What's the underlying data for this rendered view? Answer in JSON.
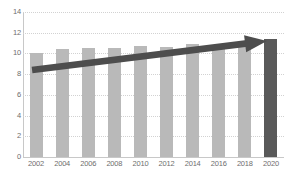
{
  "chart_data": {
    "type": "bar",
    "title": "",
    "subtitle": "",
    "xlabel": "",
    "ylabel": "",
    "categories": [
      "2002",
      "2004",
      "2006",
      "2008",
      "2010",
      "2012",
      "2014",
      "2016",
      "2018",
      "2020"
    ],
    "values": [
      10.0,
      10.4,
      10.5,
      10.5,
      10.7,
      10.6,
      10.9,
      10.5,
      10.6,
      11.4
    ],
    "series": [
      {
        "name": "Value",
        "values": [
          10.0,
          10.4,
          10.5,
          10.5,
          10.7,
          10.6,
          10.9,
          10.5,
          10.6,
          11.4
        ]
      }
    ],
    "ylim": [
      0,
      14
    ],
    "yticks": [
      0,
      2,
      4,
      6,
      8,
      10,
      12,
      14
    ],
    "ytick_labels": [
      "0",
      "2",
      "4",
      "6",
      "8",
      "10",
      "12",
      "14"
    ],
    "grid": true,
    "grid_axis": "y",
    "grid_style": "dotted",
    "legend": false,
    "legend_position": "none",
    "bar_color": "#b9b9b9",
    "highlight_color": "#595959",
    "highlight_index": 9,
    "background_color": "#ffffff",
    "tick_label_color": "#6e6e6e",
    "gridline_color": "#d2d2d2",
    "annotations": [
      {
        "name": "trend-arrow",
        "type": "arrow",
        "color": "#4d4d4d",
        "from_category": "2002",
        "to_category": "2020",
        "from_value": 8.4,
        "to_value": 11.2,
        "label": ""
      }
    ]
  }
}
